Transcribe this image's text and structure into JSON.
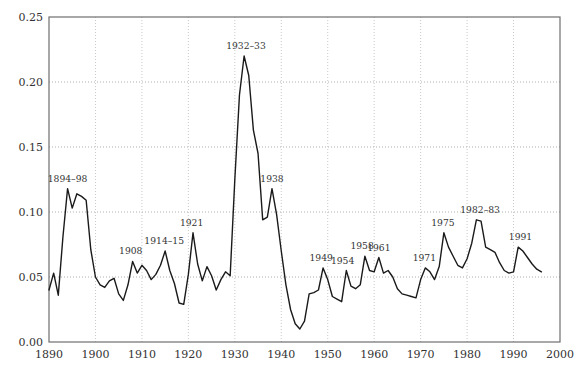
{
  "figure": {
    "colors": {
      "background": "#ffffff",
      "line": "#1a1a1a",
      "axis_box": "#6e6e6e",
      "grid_horizontal": "#b0b0b0",
      "grid_vertical": "#c9c9c9",
      "tick_text": "#333333",
      "annotation_text": "#3a3a3a"
    }
  },
  "chart_data": {
    "type": "line",
    "title": "",
    "xlabel": "",
    "ylabel": "",
    "x_range": [
      1890,
      2000
    ],
    "y_range": [
      0.0,
      0.25
    ],
    "grid": true,
    "legend": "none",
    "x_tick_years": [
      1890,
      1900,
      1910,
      1920,
      1930,
      1940,
      1950,
      1960,
      1970,
      1980,
      1990,
      2000
    ],
    "x_tick_labels": [
      "1890",
      "1900",
      "1910",
      "1920",
      "1930",
      "1940",
      "1950",
      "1960",
      "1970",
      "1980",
      "1990",
      "2000"
    ],
    "y_tick_values": [
      0.0,
      0.05,
      0.1,
      0.15,
      0.2,
      0.25
    ],
    "y_tick_labels": [
      "0.00",
      "0.05",
      "0.10",
      "0.15",
      "0.20",
      "0.25"
    ],
    "series": [
      {
        "name": "unemployment rate",
        "start_year": 1890,
        "end_year": 1996,
        "values": [
          0.04,
          0.053,
          0.036,
          0.081,
          0.118,
          0.103,
          0.114,
          0.112,
          0.109,
          0.071,
          0.05,
          0.044,
          0.042,
          0.047,
          0.049,
          0.037,
          0.032,
          0.044,
          0.062,
          0.053,
          0.059,
          0.055,
          0.048,
          0.052,
          0.059,
          0.07,
          0.055,
          0.045,
          0.03,
          0.029,
          0.052,
          0.084,
          0.06,
          0.047,
          0.058,
          0.051,
          0.04,
          0.048,
          0.054,
          0.051,
          0.125,
          0.19,
          0.22,
          0.205,
          0.163,
          0.145,
          0.094,
          0.096,
          0.118,
          0.098,
          0.07,
          0.044,
          0.025,
          0.014,
          0.01,
          0.016,
          0.037,
          0.038,
          0.04,
          0.057,
          0.048,
          0.035,
          0.033,
          0.031,
          0.055,
          0.043,
          0.041,
          0.044,
          0.066,
          0.055,
          0.054,
          0.065,
          0.053,
          0.055,
          0.05,
          0.041,
          0.037,
          0.036,
          0.035,
          0.034,
          0.048,
          0.057,
          0.054,
          0.048,
          0.058,
          0.084,
          0.073,
          0.066,
          0.059,
          0.057,
          0.064,
          0.076,
          0.094,
          0.093,
          0.073,
          0.071,
          0.069,
          0.061,
          0.055,
          0.053,
          0.054,
          0.073,
          0.07,
          0.065,
          0.06,
          0.056,
          0.054
        ]
      }
    ],
    "annotations": [
      {
        "label": "1894–98",
        "x": 1894.0,
        "y": 0.118
      },
      {
        "label": "1908",
        "x": 1907.6,
        "y": 0.062
      },
      {
        "label": "1914–15",
        "x": 1914.8,
        "y": 0.07
      },
      {
        "label": "1921",
        "x": 1920.7,
        "y": 0.084
      },
      {
        "label": "1932–33",
        "x": 1932.4,
        "y": 0.22
      },
      {
        "label": "1938",
        "x": 1938.0,
        "y": 0.118
      },
      {
        "label": "1949",
        "x": 1948.6,
        "y": 0.057
      },
      {
        "label": "1954",
        "x": 1953.2,
        "y": 0.055
      },
      {
        "label": "1958",
        "x": 1957.4,
        "y": 0.066
      },
      {
        "label": "1961",
        "x": 1961.0,
        "y": 0.065
      },
      {
        "label": "1971",
        "x": 1970.8,
        "y": 0.057
      },
      {
        "label": "1975",
        "x": 1974.8,
        "y": 0.084
      },
      {
        "label": "1982–83",
        "x": 1982.8,
        "y": 0.094
      },
      {
        "label": "1991",
        "x": 1991.5,
        "y": 0.073
      }
    ]
  }
}
